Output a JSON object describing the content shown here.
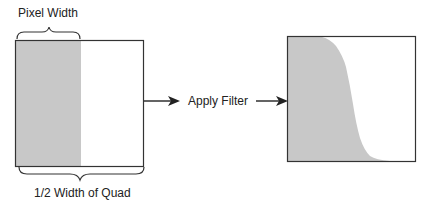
{
  "diagram": {
    "top_label": "Pixel Width",
    "bottom_label": "1/2 Width of Quad",
    "process_label": "Apply Filter",
    "colors": {
      "fill": "#c8c8c8",
      "stroke": "#333333",
      "background": "#ffffff"
    }
  }
}
